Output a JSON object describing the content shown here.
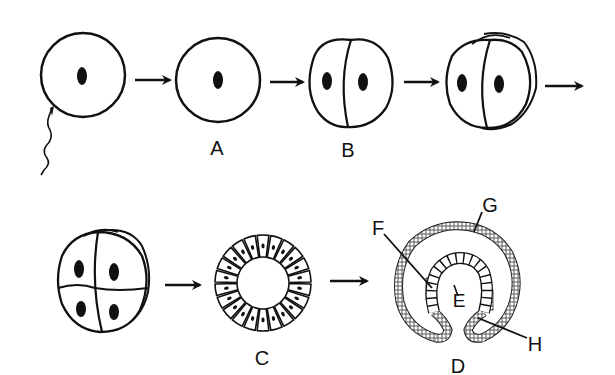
{
  "diagram": {
    "stages": [
      {
        "id": "fertilization",
        "label": "",
        "description": "egg with sperm"
      },
      {
        "id": "zygote",
        "label": "A",
        "description": "zygote (single cell with nucleus)"
      },
      {
        "id": "two-cell",
        "label": "B",
        "description": "2-cell stage"
      },
      {
        "id": "four-cell-side",
        "label": "",
        "description": "4-cell stage (side view)"
      },
      {
        "id": "eight-cell",
        "label": "",
        "description": "8-cell stage"
      },
      {
        "id": "blastula",
        "label": "C",
        "description": "blastula (hollow ring of cells)"
      },
      {
        "id": "gastrula",
        "label": "D",
        "description": "gastrula"
      }
    ],
    "part_labels": {
      "E": "E",
      "F": "F",
      "G": "G",
      "H": "H"
    },
    "colors": {
      "ink": "#111111",
      "background": "#ffffff"
    }
  }
}
